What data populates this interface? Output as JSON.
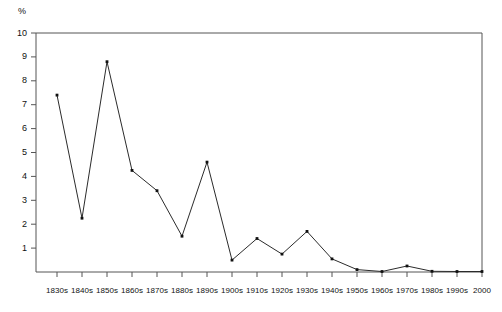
{
  "chart_data": {
    "type": "line",
    "title": "",
    "subtitle": "",
    "xlabel": "",
    "ylabel": "%",
    "unit_label": "%",
    "categories": [
      "1830s",
      "1840s",
      "1850s",
      "1860s",
      "1870s",
      "1880s",
      "1890s",
      "1900s",
      "1910s",
      "1920s",
      "1930s",
      "1940s",
      "1950s",
      "1960s",
      "1970s",
      "1980s",
      "1990s",
      "2000"
    ],
    "values": [
      7.4,
      2.25,
      8.8,
      4.25,
      3.4,
      1.5,
      4.6,
      0.5,
      1.4,
      0.75,
      1.7,
      0.55,
      0.1,
      0.02,
      0.25,
      0.03,
      0.02,
      0.02
    ],
    "ylim": [
      0,
      10
    ],
    "y_ticks": [
      1,
      2,
      3,
      4,
      5,
      6,
      7,
      8,
      9,
      10
    ],
    "y_tick_labels": [
      "1",
      "2",
      "3",
      "4",
      "5",
      "6",
      "7",
      "8",
      "9",
      "10"
    ],
    "grid": false,
    "legend": null,
    "legend_position": "none",
    "marker": "square-dot",
    "line_color": "#2b2b2b",
    "marker_color": "#111111",
    "axis_color": "#555555",
    "background_color": "#ffffff"
  }
}
